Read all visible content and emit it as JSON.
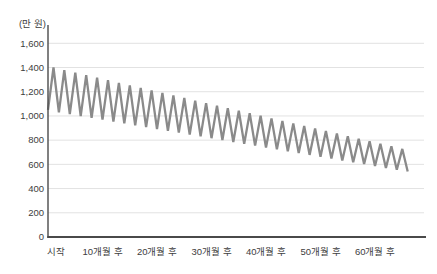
{
  "chart_data": {
    "type": "line",
    "title": "",
    "ylabel": "(만 원)",
    "xlabel": "",
    "x_unit": "개월",
    "x_tick_labels": [
      "시작",
      "10개월 후",
      "20개월 후",
      "30개월 후",
      "40개월 후",
      "50개월 후",
      "60개월 후"
    ],
    "x_tick_months": [
      0,
      10,
      20,
      30,
      40,
      50,
      60
    ],
    "y_tick_labels": [
      "0",
      "200",
      "400",
      "600",
      "800",
      "1,000",
      "1,200",
      "1,400",
      "1,600"
    ],
    "y_ticks": [
      0,
      200,
      400,
      600,
      800,
      1000,
      1200,
      1400,
      1600
    ],
    "ylim": [
      0,
      1600
    ],
    "xlim": [
      0,
      68
    ],
    "grid": "horizontal-only",
    "legend": "none",
    "colors": {
      "line": "#8a8a8a",
      "axis": "#4a4a4a",
      "grid": "#e2e2e2",
      "text": "#3d3d3d"
    },
    "series": [
      {
        "points": [
          [
            0,
            1050
          ],
          [
            1,
            1400
          ],
          [
            2,
            1030
          ],
          [
            3,
            1379
          ],
          [
            4,
            1015
          ],
          [
            5,
            1358
          ],
          [
            6,
            999
          ],
          [
            7,
            1337
          ],
          [
            8,
            984
          ],
          [
            9,
            1316
          ],
          [
            10,
            969
          ],
          [
            11,
            1295
          ],
          [
            12,
            954
          ],
          [
            13,
            1274
          ],
          [
            14,
            938
          ],
          [
            15,
            1253
          ],
          [
            16,
            923
          ],
          [
            17,
            1232
          ],
          [
            18,
            908
          ],
          [
            19,
            1211
          ],
          [
            20,
            892
          ],
          [
            21,
            1190
          ],
          [
            22,
            877
          ],
          [
            23,
            1169
          ],
          [
            24,
            862
          ],
          [
            25,
            1148
          ],
          [
            26,
            846
          ],
          [
            27,
            1127
          ],
          [
            28,
            831
          ],
          [
            29,
            1106
          ],
          [
            30,
            816
          ],
          [
            31,
            1085
          ],
          [
            32,
            801
          ],
          [
            33,
            1064
          ],
          [
            34,
            785
          ],
          [
            35,
            1043
          ],
          [
            36,
            770
          ],
          [
            37,
            1022
          ],
          [
            38,
            755
          ],
          [
            39,
            1001
          ],
          [
            40,
            739
          ],
          [
            41,
            980
          ],
          [
            42,
            724
          ],
          [
            43,
            959
          ],
          [
            44,
            709
          ],
          [
            45,
            938
          ],
          [
            46,
            693
          ],
          [
            47,
            917
          ],
          [
            48,
            678
          ],
          [
            49,
            896
          ],
          [
            50,
            663
          ],
          [
            51,
            875
          ],
          [
            52,
            648
          ],
          [
            53,
            854
          ],
          [
            54,
            632
          ],
          [
            55,
            833
          ],
          [
            56,
            617
          ],
          [
            57,
            812
          ],
          [
            58,
            602
          ],
          [
            59,
            791
          ],
          [
            60,
            586
          ],
          [
            61,
            770
          ],
          [
            62,
            571
          ],
          [
            63,
            749
          ],
          [
            64,
            556
          ],
          [
            65,
            728
          ],
          [
            66,
            540
          ]
        ]
      }
    ]
  }
}
